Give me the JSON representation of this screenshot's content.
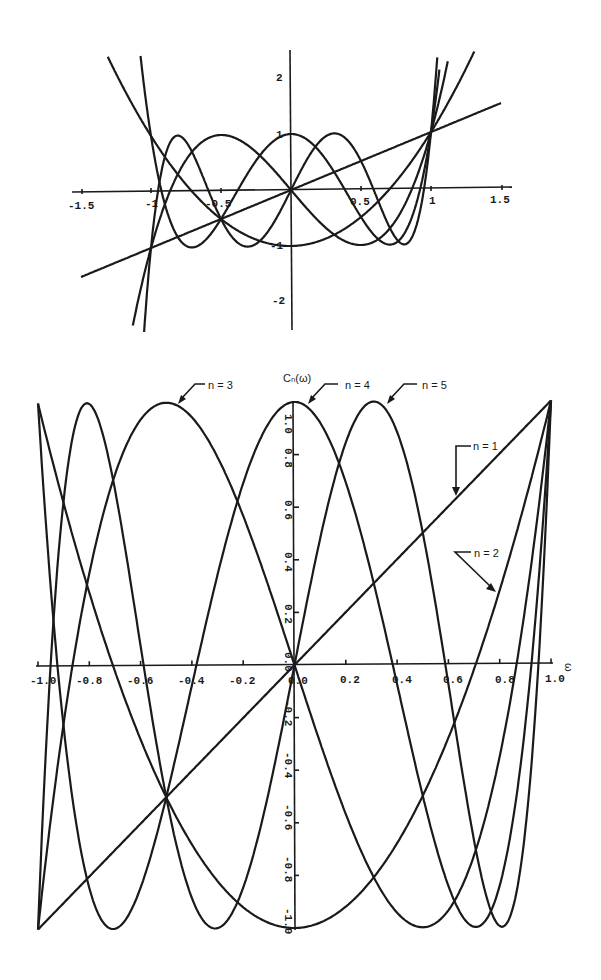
{
  "chart_data": [
    {
      "type": "line",
      "title": "",
      "xlabel": "",
      "ylabel": "",
      "xlim": [
        -1.5,
        1.5
      ],
      "ylim": [
        -2.5,
        2.5
      ],
      "grid": false,
      "legend": null,
      "x_ticks": [
        "-1.5",
        "-1",
        "-0.5",
        "0.5",
        "1",
        "1.5"
      ],
      "y_ticks": [
        "2",
        "1",
        "-1",
        "-2"
      ],
      "description": "Chebyshev polynomials T1..T5 plotted over extended range showing rapid growth beyond |x|>1",
      "series": [
        {
          "name": "n=1",
          "formula": "x",
          "x_range": [
            -1.5,
            1.5
          ]
        },
        {
          "name": "n=2",
          "formula": "2x^2-1",
          "x_range": [
            -1.37,
            1.35
          ]
        },
        {
          "name": "n=3",
          "formula": "4x^3-3x",
          "x_range": [
            -1.13,
            1.12
          ]
        },
        {
          "name": "n=4",
          "formula": "8x^4-8x^2+1",
          "x_range": [
            -1.08,
            1.06
          ]
        },
        {
          "name": "n=5",
          "formula": "16x^5-20x^3+5x",
          "x_range": [
            -1.06,
            1.05
          ]
        }
      ]
    },
    {
      "type": "line",
      "title": "Cₙ(ω)",
      "xlabel": "ω",
      "ylabel": "Cₙ(ω)",
      "xlim": [
        -1.0,
        1.0
      ],
      "ylim": [
        -1.0,
        1.0
      ],
      "grid": false,
      "x_ticks": [
        "-1.0",
        "-0.8",
        "-0.6",
        "-0.4",
        "-0.2",
        "0.0",
        "0.2",
        "0.4",
        "0.6",
        "0.8",
        "1.0"
      ],
      "y_ticks": [
        "1.0",
        "0.8",
        "0.6",
        "0.4",
        "0.2",
        "0.0",
        "-0.2",
        "-0.4",
        "-0.6",
        "-0.8",
        "-1.0"
      ],
      "series": [
        {
          "name": "n = 1",
          "formula": "x",
          "x_range": [
            -1,
            1
          ]
        },
        {
          "name": "n = 2",
          "formula": "2x^2-1",
          "x_range": [
            -1,
            1
          ]
        },
        {
          "name": "n = 3",
          "formula": "4x^3-3x",
          "x_range": [
            -1,
            1
          ]
        },
        {
          "name": "n = 4",
          "formula": "8x^4-8x^2+1",
          "x_range": [
            -1,
            1
          ]
        },
        {
          "name": "n = 5",
          "formula": "16x^5-20x^3+5x",
          "x_range": [
            -1,
            1
          ]
        }
      ],
      "annotations": [
        {
          "text": "n = 3",
          "points_to": [
            -0.5,
            1.0
          ]
        },
        {
          "text": "n = 4",
          "points_to": [
            0.0,
            1.0
          ]
        },
        {
          "text": "n = 5",
          "points_to": [
            0.31,
            1.0
          ]
        },
        {
          "text": "n = 1",
          "points_to": [
            0.62,
            0.62
          ]
        },
        {
          "text": "n = 2",
          "points_to": [
            0.78,
            0.22
          ]
        }
      ]
    }
  ],
  "top_plot": {
    "x_tick_labels": [
      "-1.5",
      "-1",
      "-0.5",
      "0.5",
      "1",
      "1.5"
    ],
    "y_tick_labels": [
      "2",
      "1",
      "-1",
      "-2"
    ]
  },
  "bottom_plot": {
    "y_axis_title": "Cₙ(ω)",
    "x_axis_title": "ω",
    "x_tick_labels": [
      "-1.0",
      "-0.8",
      "-0.6",
      "-0.4",
      "-0.2",
      "0.0",
      "0.2",
      "0.4",
      "0.6",
      "0.8",
      "1.0"
    ],
    "y_tick_labels_pos": [
      "1.0",
      "0.8",
      "0.6",
      "0.4",
      "0.2",
      "0.0"
    ],
    "y_tick_labels_neg": [
      "-0.2",
      "-0.4",
      "-0.6",
      "-0.8",
      "-1.0"
    ],
    "labels": {
      "n1": "n = 1",
      "n2": "n = 2",
      "n3": "n = 3",
      "n4": "n = 4",
      "n5": "n = 5"
    }
  }
}
